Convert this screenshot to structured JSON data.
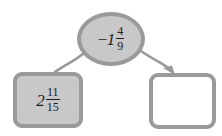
{
  "diagram": {
    "type": "number-bond-flow",
    "background_color": "#ffffff",
    "node_fill_gray": "#c8c8c8",
    "node_fill_white": "#ffffff",
    "node_border_gray": "#9a9a9a",
    "connector_color": "#9a9a9a",
    "text_color": "#1c1c1c",
    "nodes": {
      "top": {
        "shape": "ellipse",
        "fill": "#c8c8c8",
        "sign": "−",
        "whole": "1",
        "numerator": "4",
        "denominator": "9",
        "value_text": "−1 4/9"
      },
      "bottom_left": {
        "shape": "rounded-square",
        "fill": "#c8c8c8",
        "sign": "",
        "whole": "2",
        "numerator": "11",
        "denominator": "15",
        "value_text": "2 11/15"
      },
      "bottom_right": {
        "shape": "rounded-square",
        "fill": "#ffffff",
        "value_text": "",
        "state": "empty"
      }
    },
    "connectors": [
      {
        "name": "top-to-bottom-left",
        "from": "top",
        "to": "bottom_left",
        "arrowhead": "none"
      },
      {
        "name": "top-to-bottom-right",
        "from": "top",
        "to": "bottom_right",
        "arrowhead": "filled-triangle"
      }
    ]
  }
}
